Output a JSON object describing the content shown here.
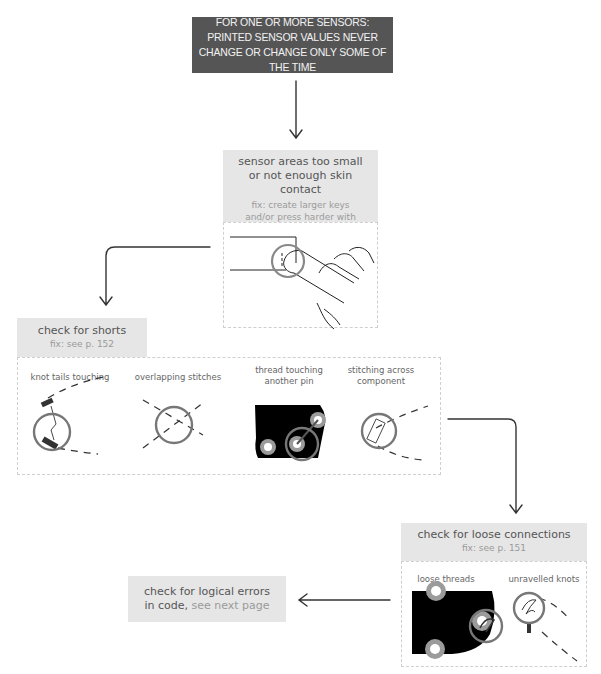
{
  "header": {
    "problem": "FOR ONE OR MORE SENSORS: PRINTED SENSOR VALUES NEVER CHANGE OR CHANGE ONLY SOME OF THE TIME"
  },
  "step1": {
    "title": "sensor areas too small or not enough skin contact",
    "fix": "fix: create larger keys and/or press harder with more skin contact",
    "illustration": "finger-on-sensor"
  },
  "step2": {
    "title": "check for shorts",
    "fix": "fix: see p. 152",
    "items": [
      {
        "caption": "knot tails touching",
        "illustration": "knot-tails-icon"
      },
      {
        "caption": "overlapping stitches",
        "illustration": "overlap-stitches-icon"
      },
      {
        "caption": "thread touching another pin",
        "illustration": "thread-pin-icon"
      },
      {
        "caption": "stitching across component",
        "illustration": "component-stitch-icon"
      }
    ]
  },
  "step3": {
    "title": "check for loose connections",
    "fix": "fix: see p. 151",
    "items": [
      {
        "caption": "loose threads",
        "illustration": "loose-threads-icon"
      },
      {
        "caption": "unravelled knots",
        "illustration": "unravelled-knot-icon"
      }
    ]
  },
  "step4": {
    "title": "check for logical errors in code,",
    "link": "see next page"
  },
  "colors": {
    "header_bg": "#555556",
    "box_bg": "#e6e6e6",
    "highlight_circle": "#777777",
    "pin_ring": "#9b9b9b"
  }
}
